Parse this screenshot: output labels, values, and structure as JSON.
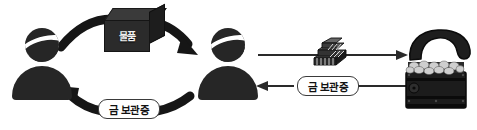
{
  "diagram": {
    "type": "cycle-exchange-flow",
    "title": "",
    "actors": [
      {
        "id": "person-left",
        "name": "person-silhouette-left",
        "label": ""
      },
      {
        "id": "person-right",
        "name": "person-silhouette-right",
        "label": ""
      },
      {
        "id": "vault",
        "name": "treasure-chest",
        "label": ""
      }
    ],
    "labels": {
      "goods": "물품",
      "gold_certificate_left": "금 보관증",
      "gold_certificate_right": "금 보관증"
    },
    "flows": [
      {
        "id": "goods-flow",
        "from": "person-left",
        "to": "person-right",
        "label": "물품",
        "shape": "curved-arc-top",
        "direction": "right"
      },
      {
        "id": "cert-return-flow",
        "from": "person-right",
        "to": "person-left",
        "label": "금 보관증",
        "shape": "curved-arc-bottom",
        "direction": "left"
      },
      {
        "id": "gold-deposit-flow",
        "from": "person-right",
        "to": "vault",
        "label": "",
        "shape": "straight-line",
        "direction": "right"
      },
      {
        "id": "cert-issue-flow",
        "from": "vault",
        "to": "person-right",
        "label": "금 보관증",
        "shape": "straight-line",
        "direction": "left"
      }
    ],
    "icons": {
      "goods_box": "cardboard-box-icon",
      "gold_bars": "gold-bars-stack-icon",
      "chest": "treasure-chest-with-coins-icon"
    },
    "colors": {
      "figure": "#262626",
      "arrow": "#1a1a1a",
      "line": "#2a2a2a",
      "pill_border": "#3a3a3a",
      "background": "#ffffff",
      "box_face": "#2b2b2b",
      "box_top": "#3a3a3a",
      "gold": "#9a9a9a"
    }
  }
}
